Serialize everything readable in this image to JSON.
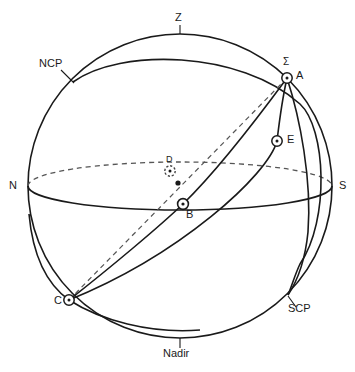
{
  "figure": {
    "width": 355,
    "height": 372,
    "background_color": "#ffffff",
    "line_color": "#1a1a1a",
    "dashed_line_color": "#555555"
  },
  "labels": {
    "zenith": "Z",
    "nadir": "Nadir",
    "north": "N",
    "south": "S",
    "north_celestial_pole": "NCP",
    "south_celestial_pole": "SCP",
    "sigma": "Σ",
    "point_a": "A",
    "point_b": "B",
    "point_c": "C",
    "point_d": "D",
    "point_e": "E"
  },
  "points": [
    {
      "name": "A",
      "label": "A",
      "x": 287,
      "y": 78,
      "marker": "circle-dot"
    },
    {
      "name": "E",
      "label": "E",
      "x": 277,
      "y": 141,
      "marker": "circle-dot"
    },
    {
      "name": "D",
      "label": "D",
      "x": 170,
      "y": 171,
      "marker": "circle-dot-dashed"
    },
    {
      "name": "B",
      "label": "B",
      "x": 183,
      "y": 204,
      "marker": "circle-dot"
    },
    {
      "name": "C",
      "label": "C",
      "x": 69,
      "y": 300,
      "marker": "circle-dot"
    },
    {
      "name": "O",
      "label": "",
      "x": 178,
      "y": 183,
      "marker": "solid-dot"
    }
  ],
  "geometry": {
    "sphere_center_x": 180,
    "sphere_center_y": 186,
    "sphere_radius": 152,
    "horizon_semi_minor": 24
  }
}
